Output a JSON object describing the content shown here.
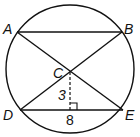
{
  "diagram": {
    "points": [
      {
        "name": "A",
        "x": 17,
        "y": 32,
        "label_x": 3,
        "label_y": 34
      },
      {
        "name": "B",
        "x": 122,
        "y": 32,
        "label_x": 124,
        "label_y": 34
      },
      {
        "name": "C",
        "x": 70,
        "y": 72,
        "label_x": 54,
        "label_y": 78
      },
      {
        "name": "D",
        "x": 20,
        "y": 110,
        "label_x": 4,
        "label_y": 120
      },
      {
        "name": "E",
        "x": 123,
        "y": 110,
        "label_x": 125,
        "label_y": 120
      }
    ],
    "circle": {
      "cx": 70,
      "cy": 70,
      "r": 64
    },
    "labels": {
      "A": "A",
      "B": "B",
      "C": "C",
      "D": "D",
      "E": "E",
      "height": "3",
      "base": "8"
    },
    "colors": {
      "stroke": "#111111",
      "background": "#ffffff"
    }
  }
}
